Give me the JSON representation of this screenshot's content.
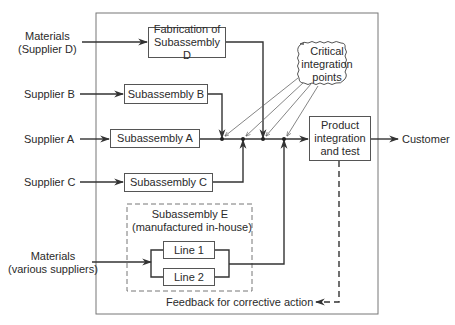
{
  "diagram": {
    "type": "supply-chain-flow",
    "inputs": {
      "materials_d": {
        "line1": "Materials",
        "line2": "(Supplier D)"
      },
      "supplier_b": "Supplier B",
      "supplier_a": "Supplier A",
      "supplier_c": "Supplier C",
      "materials_various": {
        "line1": "Materials",
        "line2": "(various suppliers)"
      }
    },
    "boxes": {
      "fabrication_d": {
        "line1": "Fabrication of",
        "line2": "Subassembly D"
      },
      "subassembly_b": "Subassembly B",
      "subassembly_a": "Subassembly A",
      "subassembly_c": "Subassembly C",
      "subassembly_e": {
        "line1": "Subassembly E",
        "line2": "(manufactured in-house)"
      },
      "line_1": "Line 1",
      "line_2": "Line 2",
      "product_integration": {
        "line1": "Product",
        "line2": "integration",
        "line3": "and test"
      }
    },
    "callout": {
      "line1": "Critical",
      "line2": "integration",
      "line3": "points"
    },
    "output": "Customer",
    "feedback": "Feedback for corrective action",
    "colors": {
      "line": "#333333",
      "box_border": "#555555",
      "dashed": "#666666"
    }
  }
}
